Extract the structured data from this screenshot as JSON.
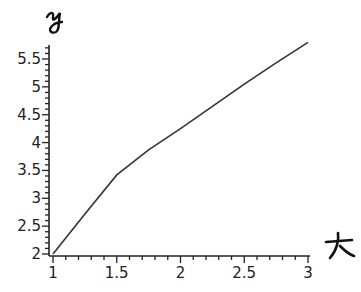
{
  "chart_data": {
    "type": "line",
    "title": "",
    "xlabel": "x (handwritten)",
    "ylabel": "y (handwritten)",
    "xlim": [
      1,
      3
    ],
    "ylim": [
      2,
      5.75
    ],
    "grid": false,
    "legend": null,
    "x_ticks": [
      "1",
      "1.5",
      "2",
      "2.5",
      "3"
    ],
    "y_ticks": [
      "2",
      "2.5",
      "3",
      "3.5",
      "4",
      "4.5",
      "5",
      "5.5"
    ],
    "series": [
      {
        "name": "curve",
        "x": [
          1,
          1.25,
          1.5,
          1.75,
          2,
          2.25,
          2.5,
          2.75,
          3
        ],
        "y": [
          2.0,
          2.72,
          3.42,
          3.87,
          4.25,
          4.65,
          5.05,
          5.43,
          5.8
        ]
      }
    ]
  },
  "labels": {
    "x_axis_hand": "x",
    "y_axis_hand": "y"
  }
}
